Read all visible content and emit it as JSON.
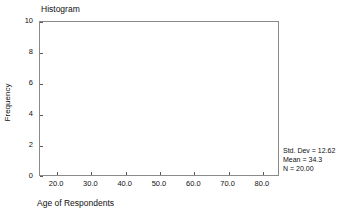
{
  "chart_data": {
    "type": "bar",
    "title": "Histogram",
    "xlabel": "Age of Respondents",
    "ylabel": "Frequency",
    "grid": false,
    "legend": "none",
    "xlim": [
      15,
      85
    ],
    "ylim": [
      0,
      10
    ],
    "x_ticks": [
      {
        "value": 20,
        "label": "20.0"
      },
      {
        "value": 30,
        "label": "30.0"
      },
      {
        "value": 40,
        "label": "40.0"
      },
      {
        "value": 50,
        "label": "50.0"
      },
      {
        "value": 60,
        "label": "60.0"
      },
      {
        "value": 70,
        "label": "70.0"
      },
      {
        "value": 80,
        "label": "80.0"
      }
    ],
    "y_ticks": [
      {
        "value": 0,
        "label": "0"
      },
      {
        "value": 2,
        "label": "2"
      },
      {
        "value": 4,
        "label": "4"
      },
      {
        "value": 6,
        "label": "6"
      },
      {
        "value": 8,
        "label": "8"
      },
      {
        "value": 10,
        "label": "10"
      }
    ],
    "categories": [],
    "values": [],
    "bars": []
  },
  "annotations": {
    "std_dev": "Std. Dev = 12.62",
    "mean": "Mean = 34.3",
    "n": "N = 20.00"
  },
  "colors": {
    "frame": "#8a8a8a",
    "tick": "#5a5a5a",
    "text": "#101010",
    "bar_fill": "#b9b9b9",
    "bar_edge": "#6e6e6e",
    "background": "#ffffff"
  }
}
